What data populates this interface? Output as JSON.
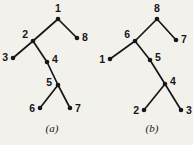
{
  "figure": {
    "background_color": "#f3f1ec",
    "ink_color": "#17161a",
    "width": 193,
    "height": 145,
    "panels": [
      {
        "id": "a",
        "caption": "(a)",
        "caption_x": 52,
        "caption_y": 132,
        "nodes": [
          {
            "id": "a1",
            "label": "1",
            "x": 58,
            "y": 19,
            "label_x": 58,
            "label_y": 12,
            "label_pos": "above"
          },
          {
            "id": "a8",
            "label": "8",
            "x": 77,
            "y": 38,
            "label_x": 82,
            "label_y": 38,
            "label_pos": "right"
          },
          {
            "id": "a2",
            "label": "2",
            "x": 33,
            "y": 41,
            "label_x": 28,
            "label_y": 38,
            "label_pos": "upleft"
          },
          {
            "id": "a3",
            "label": "3",
            "x": 13,
            "y": 58,
            "label_x": 8,
            "label_y": 58,
            "label_pos": "left"
          },
          {
            "id": "a4",
            "label": "4",
            "x": 47,
            "y": 62,
            "label_x": 52,
            "label_y": 60,
            "label_pos": "right"
          },
          {
            "id": "a5",
            "label": "5",
            "x": 58,
            "y": 85,
            "label_x": 52,
            "label_y": 83,
            "label_pos": "left"
          },
          {
            "id": "a6",
            "label": "6",
            "x": 40,
            "y": 108,
            "label_x": 35,
            "label_y": 109,
            "label_pos": "left"
          },
          {
            "id": "a7",
            "label": "7",
            "x": 70,
            "y": 108,
            "label_x": 75,
            "label_y": 109,
            "label_pos": "right"
          }
        ],
        "edges": [
          {
            "from": "a1",
            "to": "a2"
          },
          {
            "from": "a1",
            "to": "a8"
          },
          {
            "from": "a2",
            "to": "a3"
          },
          {
            "from": "a2",
            "to": "a4"
          },
          {
            "from": "a4",
            "to": "a5"
          },
          {
            "from": "a5",
            "to": "a6"
          },
          {
            "from": "a5",
            "to": "a7"
          }
        ]
      },
      {
        "id": "b",
        "caption": "(b)",
        "caption_x": 152,
        "caption_y": 132,
        "nodes": [
          {
            "id": "b8",
            "label": "8",
            "x": 157,
            "y": 19,
            "label_x": 157,
            "label_y": 12,
            "label_pos": "above"
          },
          {
            "id": "b6",
            "label": "6",
            "x": 135,
            "y": 41,
            "label_x": 130,
            "label_y": 38,
            "label_pos": "upleft"
          },
          {
            "id": "b7",
            "label": "7",
            "x": 176,
            "y": 40,
            "label_x": 181,
            "label_y": 40,
            "label_pos": "right"
          },
          {
            "id": "b1",
            "label": "1",
            "x": 110,
            "y": 59,
            "label_x": 105,
            "label_y": 60,
            "label_pos": "left"
          },
          {
            "id": "b5",
            "label": "5",
            "x": 150,
            "y": 60,
            "label_x": 155,
            "label_y": 58,
            "label_pos": "right"
          },
          {
            "id": "b4",
            "label": "4",
            "x": 165,
            "y": 84,
            "label_x": 170,
            "label_y": 82,
            "label_pos": "right"
          },
          {
            "id": "b2",
            "label": "2",
            "x": 144,
            "y": 110,
            "label_x": 139,
            "label_y": 111,
            "label_pos": "left"
          },
          {
            "id": "b3",
            "label": "3",
            "x": 181,
            "y": 110,
            "label_x": 186,
            "label_y": 111,
            "label_pos": "right"
          }
        ],
        "edges": [
          {
            "from": "b8",
            "to": "b6"
          },
          {
            "from": "b8",
            "to": "b7"
          },
          {
            "from": "b6",
            "to": "b1"
          },
          {
            "from": "b6",
            "to": "b5"
          },
          {
            "from": "b5",
            "to": "b4"
          },
          {
            "from": "b4",
            "to": "b2"
          },
          {
            "from": "b4",
            "to": "b3"
          }
        ]
      }
    ]
  }
}
